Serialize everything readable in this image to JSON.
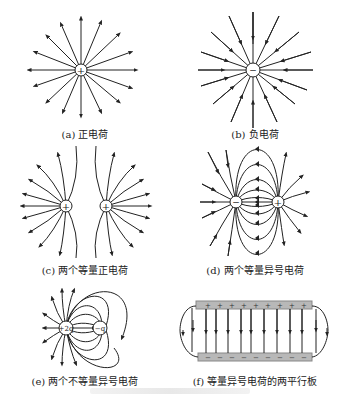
{
  "figure": {
    "panels": [
      {
        "id": "a",
        "caption": "(a) 正电荷",
        "charges": [
          {
            "sign": "+"
          }
        ],
        "field_direction": "outward",
        "line_count": 16
      },
      {
        "id": "b",
        "caption": "(b) 负电荷",
        "charges": [
          {
            "sign": "−"
          }
        ],
        "field_direction": "inward",
        "line_count": 16
      },
      {
        "id": "c",
        "caption": "(c) 两个等量正电荷",
        "charges": [
          {
            "sign": "+"
          },
          {
            "sign": "+"
          }
        ],
        "field_direction": "outward"
      },
      {
        "id": "d",
        "caption": "(d) 两个等量异号电荷",
        "charges": [
          {
            "sign": "−"
          },
          {
            "sign": "+"
          }
        ],
        "field_direction": "from + to −"
      },
      {
        "id": "e",
        "caption": "(e) 两个不等量异号电荷",
        "charges": [
          {
            "sign": "+",
            "label": "+2q"
          },
          {
            "sign": "−",
            "label": "−q"
          }
        ],
        "field_direction": "from +2q outward / to −q"
      },
      {
        "id": "f",
        "caption": "(f) 等量异号电荷的两平行板",
        "plates": {
          "top": "+",
          "bottom": "−",
          "top_marks": 9,
          "bottom_marks": 9
        },
        "field_direction": "downward"
      }
    ],
    "colors": {
      "line": "#222222",
      "plate": "#b8b8b8",
      "charge_fill": "#ffffff"
    }
  }
}
